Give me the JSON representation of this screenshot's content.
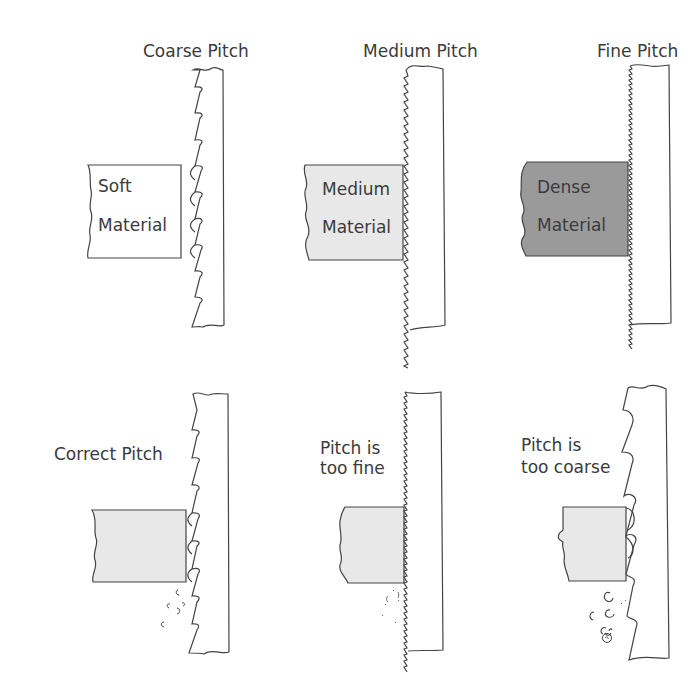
{
  "top_row": {
    "coarse": {
      "title": "Coarse Pitch",
      "material_line1": "Soft",
      "material_line2": "Material",
      "fill": "#ffffff"
    },
    "medium": {
      "title": "Medium Pitch",
      "material_line1": "Medium",
      "material_line2": "Material",
      "fill": "#e8e8e8"
    },
    "fine": {
      "title": "Fine Pitch",
      "material_line1": "Dense",
      "material_line2": "Material",
      "fill": "#9a9a9a"
    }
  },
  "bottom_row": {
    "correct": {
      "label": "Correct Pitch",
      "fill": "#e8e8e8"
    },
    "too_fine": {
      "label_line1": "Pitch is",
      "label_line2": "too fine",
      "fill": "#e8e8e8"
    },
    "too_coarse": {
      "label_line1": "Pitch is",
      "label_line2": "too coarse",
      "fill": "#e8e8e8"
    }
  },
  "colors": {
    "stroke": "#444444",
    "text": "#3a3a3a"
  }
}
